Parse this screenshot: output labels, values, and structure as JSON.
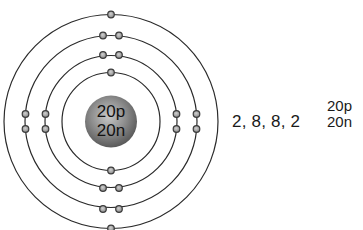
{
  "nucleus": {
    "protons_label": "20p",
    "neutrons_label": "20n",
    "color": "#8a8a8a"
  },
  "shells": [
    {
      "index": 1,
      "electrons": 2
    },
    {
      "index": 2,
      "electrons": 8
    },
    {
      "index": 3,
      "electrons": 8
    },
    {
      "index": 4,
      "electrons": 2
    }
  ],
  "electron_configuration": "2, 8, 8, 2",
  "legend": {
    "protons": "20p",
    "neutrons": "20n"
  },
  "colors": {
    "orbit": "#2a2a2a",
    "electron_fill": "#9a9a9a",
    "electron_stroke": "#3a3a3a",
    "text": "#1a1a1a"
  }
}
